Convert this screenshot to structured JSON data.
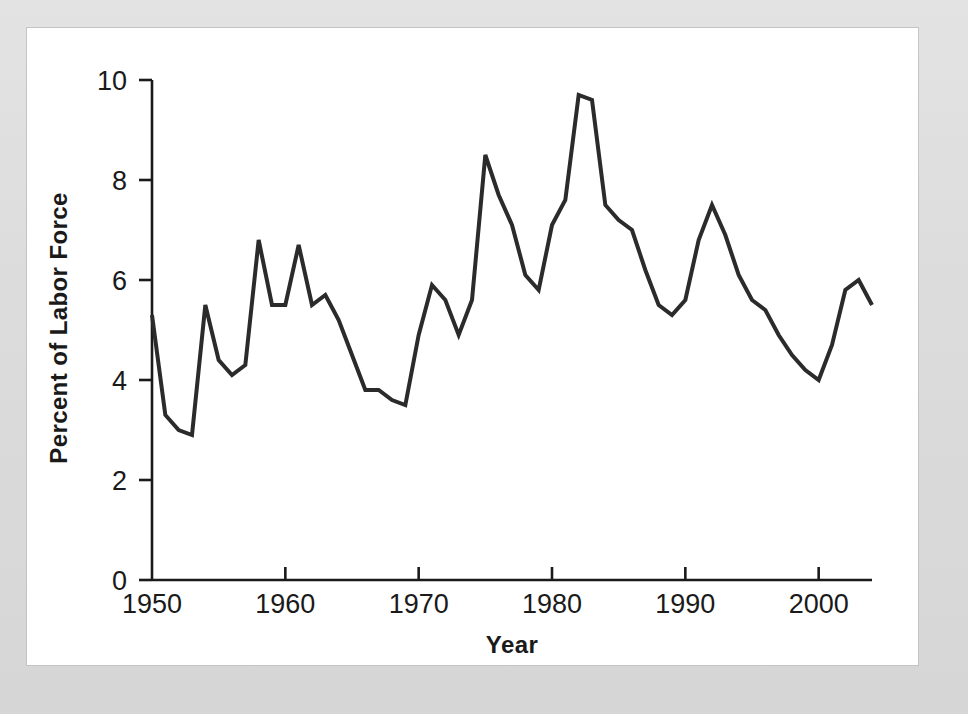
{
  "figure": {
    "background_color": "#d9d9d9",
    "panel_color": "#ffffff",
    "line_color": "#2b2b2b",
    "axis_color": "#1a1a1a"
  },
  "chart_data": {
    "type": "line",
    "title": "",
    "xlabel": "Year",
    "ylabel": "Percent of Labor Force",
    "xlim": [
      1950,
      2004
    ],
    "ylim": [
      0,
      10
    ],
    "xticks": [
      1950,
      1960,
      1970,
      1980,
      1990,
      2000
    ],
    "xtick_labels": [
      "1950",
      "1960",
      "1970",
      "1980",
      "1990",
      "2000"
    ],
    "yticks": [
      0,
      2,
      4,
      6,
      8,
      10
    ],
    "ytick_labels": [
      "0",
      "2",
      "4",
      "6",
      "8",
      "10"
    ],
    "grid": false,
    "legend": false,
    "x": [
      1950,
      1951,
      1952,
      1953,
      1954,
      1955,
      1956,
      1957,
      1958,
      1959,
      1960,
      1961,
      1962,
      1963,
      1964,
      1965,
      1966,
      1967,
      1968,
      1969,
      1970,
      1971,
      1972,
      1973,
      1974,
      1975,
      1976,
      1977,
      1978,
      1979,
      1980,
      1981,
      1982,
      1983,
      1984,
      1985,
      1986,
      1987,
      1988,
      1989,
      1990,
      1991,
      1992,
      1993,
      1994,
      1995,
      1996,
      1997,
      1998,
      1999,
      2000,
      2001,
      2002,
      2003,
      2004
    ],
    "values": [
      5.3,
      3.3,
      3.0,
      2.9,
      5.5,
      4.4,
      4.1,
      4.3,
      6.8,
      5.5,
      5.5,
      6.7,
      5.5,
      5.7,
      5.2,
      4.5,
      3.8,
      3.8,
      3.6,
      3.5,
      4.9,
      5.9,
      5.6,
      4.9,
      5.6,
      8.5,
      7.7,
      7.1,
      6.1,
      5.8,
      7.1,
      7.6,
      9.7,
      9.6,
      7.5,
      7.2,
      7.0,
      6.2,
      5.5,
      5.3,
      5.6,
      6.8,
      7.5,
      6.9,
      6.1,
      5.6,
      5.4,
      4.9,
      4.5,
      4.2,
      4.0,
      4.7,
      5.8,
      6.0,
      5.5
    ]
  }
}
